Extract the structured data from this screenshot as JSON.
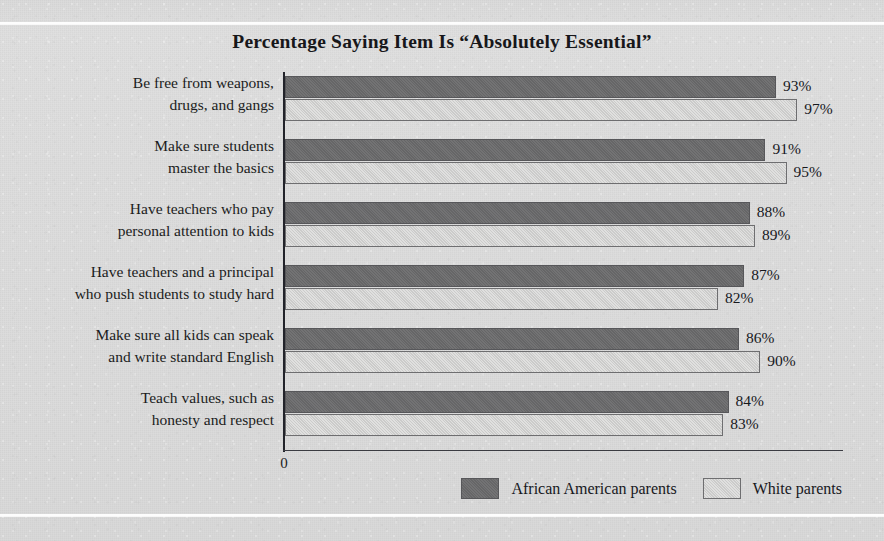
{
  "chart_data": {
    "type": "bar",
    "orientation": "horizontal",
    "title": "Percentage Saying Item Is “Absolutely Essential”",
    "xlabel": "",
    "ylabel": "",
    "xlim": [
      0,
      105
    ],
    "grid": false,
    "axis_origin_label": "0",
    "legend_position": "bottom-right",
    "categories": [
      "Be free from weapons, drugs, and gangs",
      "Make sure students master the basics",
      "Have teachers who pay personal attention to kids",
      "Have teachers and a principal who push students to study hard",
      "Make sure all kids can speak and write standard English",
      "Teach values, such as honesty and respect"
    ],
    "category_lines": [
      [
        "Be free from weapons,",
        "drugs, and gangs"
      ],
      [
        "Make sure students",
        "master the basics"
      ],
      [
        "Have teachers who pay",
        "personal attention to kids"
      ],
      [
        "Have teachers and a principal",
        "who push students to study hard"
      ],
      [
        "Make sure all kids can speak",
        "and write standard English"
      ],
      [
        "Teach values, such as",
        "honesty and respect"
      ]
    ],
    "series": [
      {
        "name": "African American parents",
        "color": "#6b6b6d",
        "values": [
          93,
          91,
          88,
          87,
          86,
          84
        ],
        "value_labels": [
          "93%",
          "91%",
          "88%",
          "87%",
          "86%",
          "84%"
        ]
      },
      {
        "name": "White parents",
        "color": "#d2d2d1",
        "values": [
          97,
          95,
          89,
          82,
          90,
          83
        ],
        "value_labels": [
          "97%",
          "95%",
          "89%",
          "82%",
          "90%",
          "83%"
        ]
      }
    ]
  },
  "legend": {
    "items": [
      {
        "label": "African American parents",
        "swatch": "dark"
      },
      {
        "label": "White parents",
        "swatch": "light"
      }
    ]
  }
}
